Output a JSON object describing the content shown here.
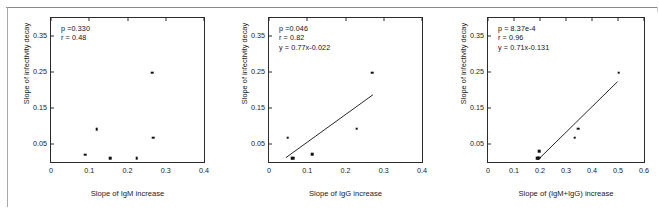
{
  "figure": {
    "shared_ylabel": "Slope of infectivity decay",
    "y_ticks": [
      "0.05",
      "0.15",
      "0.25",
      "0.35"
    ],
    "ylim": [
      0.0,
      0.4
    ],
    "point_color": "#111111",
    "line_color": "#111111",
    "axis_color": "#2b2b2b"
  },
  "chart_data": [
    {
      "type": "scatter",
      "panel": 1,
      "title": "",
      "xlabel": "Slope of IgM increase",
      "ylabel": "Slope of infectivity decay",
      "xlim": [
        0.0,
        0.4
      ],
      "ylim": [
        0.0,
        0.4
      ],
      "x_ticks": [
        "0",
        "0.1",
        "0.2",
        "0.3",
        "0.4"
      ],
      "x_tick_values": [
        0,
        0.1,
        0.2,
        0.3,
        0.4
      ],
      "y_ticks": [
        "0.05",
        "0.15",
        "0.25",
        "0.35"
      ],
      "y_tick_values": [
        0.05,
        0.15,
        0.25,
        0.35
      ],
      "grid": false,
      "legend": "none",
      "annotations": {
        "p_label": "p =0.330",
        "r_label": "r = 0.48",
        "equation": ""
      },
      "stats": {
        "p": 0.33,
        "r": 0.48
      },
      "has_fit_line": false,
      "points": [
        {
          "x": 0.089,
          "y": 0.02
        },
        {
          "x": 0.119,
          "y": 0.091
        },
        {
          "x": 0.155,
          "y": 0.011
        },
        {
          "x": 0.224,
          "y": 0.011
        },
        {
          "x": 0.264,
          "y": 0.248
        },
        {
          "x": 0.267,
          "y": 0.068
        }
      ]
    },
    {
      "type": "scatter",
      "panel": 2,
      "title": "",
      "xlabel": "Slope of IgG increase",
      "ylabel": "Slope of infectivity decay",
      "xlim": [
        0.0,
        0.4
      ],
      "ylim": [
        0.0,
        0.4
      ],
      "x_ticks": [
        "0",
        "0.1",
        "0.2",
        "0.3",
        "0.4"
      ],
      "x_tick_values": [
        0,
        0.1,
        0.2,
        0.3,
        0.4
      ],
      "y_ticks": [
        "0.05",
        "0.15",
        "0.25",
        "0.35"
      ],
      "y_tick_values": [
        0.05,
        0.15,
        0.25,
        0.35
      ],
      "grid": false,
      "legend": "none",
      "annotations": {
        "p_label": "p =0.046",
        "r_label": "r = 0.82",
        "equation": "y = 0.77x-0.022"
      },
      "stats": {
        "p": 0.046,
        "r": 0.82,
        "slope": 0.77,
        "intercept": -0.022
      },
      "has_fit_line": true,
      "fit_line": {
        "x1": 0.044,
        "y1": 0.012,
        "x2": 0.272,
        "y2": 0.187
      },
      "points": [
        {
          "x": 0.049,
          "y": 0.068
        },
        {
          "x": 0.059,
          "y": 0.01
        },
        {
          "x": 0.063,
          "y": 0.01
        },
        {
          "x": 0.113,
          "y": 0.021
        },
        {
          "x": 0.229,
          "y": 0.093
        },
        {
          "x": 0.27,
          "y": 0.248
        }
      ]
    },
    {
      "type": "scatter",
      "panel": 3,
      "title": "",
      "xlabel": "Slope of (IgM+IgG) increase",
      "ylabel": "Slope of infectivity decay",
      "xlim": [
        0.0,
        0.6
      ],
      "ylim": [
        0.0,
        0.4
      ],
      "x_ticks": [
        "0",
        "0.1",
        "0.2",
        "0.3",
        "0.4",
        "0.5",
        "0.6"
      ],
      "x_tick_values": [
        0,
        0.1,
        0.2,
        0.3,
        0.4,
        0.5,
        0.6
      ],
      "y_ticks": [
        "0.05",
        "0.15",
        "0.25",
        "0.35"
      ],
      "y_tick_values": [
        0.05,
        0.15,
        0.25,
        0.35
      ],
      "grid": false,
      "legend": "none",
      "annotations": {
        "p_label": "p = 8.37e-4",
        "r_label": "r = 0.96",
        "equation": "y = 0.71x-0.131"
      },
      "stats": {
        "p": 0.000837,
        "r": 0.96,
        "slope": 0.71,
        "intercept": -0.131
      },
      "has_fit_line": true,
      "fit_line": {
        "x1": 0.192,
        "y1": 0.006,
        "x2": 0.498,
        "y2": 0.223
      },
      "points": [
        {
          "x": 0.19,
          "y": 0.01
        },
        {
          "x": 0.193,
          "y": 0.011
        },
        {
          "x": 0.196,
          "y": 0.012
        },
        {
          "x": 0.198,
          "y": 0.03
        },
        {
          "x": 0.333,
          "y": 0.068
        },
        {
          "x": 0.347,
          "y": 0.092
        },
        {
          "x": 0.503,
          "y": 0.248
        }
      ]
    }
  ]
}
